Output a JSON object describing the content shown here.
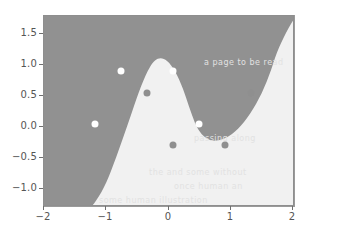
{
  "chart_data": {
    "type": "scatter",
    "title": "",
    "subtitle": "",
    "xlabel": "",
    "ylabel": "",
    "xlim": [
      -2.0,
      2.8
    ],
    "ylim": [
      -1.35,
      1.8
    ],
    "grid": false,
    "legend": null,
    "x_ticks": [
      {
        "value": -2,
        "label": "−2"
      },
      {
        "value": -1,
        "label": "−1"
      },
      {
        "value": 0,
        "label": "0"
      },
      {
        "value": 1,
        "label": "1"
      },
      {
        "value": 2,
        "label": "2"
      }
    ],
    "y_ticks": [
      {
        "value": 1.5,
        "label": "1.5"
      },
      {
        "value": 1.0,
        "label": "1.0"
      },
      {
        "value": 0.5,
        "label": "0.5"
      },
      {
        "value": 0.0,
        "label": "0.0"
      },
      {
        "value": -0.5,
        "label": "−0.5"
      },
      {
        "value": -1.0,
        "label": "−1.0"
      }
    ],
    "series": [
      {
        "name": "class-0",
        "marker": "circle",
        "color": "#ffffff",
        "points": [
          {
            "x": -1.0,
            "y": 0.0
          },
          {
            "x": -0.5,
            "y": 0.87
          },
          {
            "x": 0.5,
            "y": 0.87
          },
          {
            "x": 1.0,
            "y": 0.0
          }
        ]
      },
      {
        "name": "class-1",
        "marker": "circle",
        "color": "#8f8f8f",
        "points": [
          {
            "x": 0.0,
            "y": 0.5
          },
          {
            "x": 0.5,
            "y": -0.35
          },
          {
            "x": 1.5,
            "y": -0.35
          },
          {
            "x": 2.0,
            "y": 0.5
          }
        ]
      }
    ],
    "decision_regions": {
      "region_dark_color": "#919191",
      "region_light_color": "#f1f1f1",
      "description": "Binary classifier decision surface: dark region occupies the left portion and a central upper lobe; light region fills the lower-right and far-right."
    }
  },
  "background_watermarks": [
    {
      "text": "a page to be read",
      "x": 300,
      "y": 55
    },
    {
      "text": "passing along",
      "x": 270,
      "y": 130
    },
    {
      "text": "the and some without",
      "x": 205,
      "y": 168
    },
    {
      "text": "once human an",
      "x": 230,
      "y": 184
    },
    {
      "text": "some human illustration",
      "x": 150,
      "y": 198
    }
  ]
}
